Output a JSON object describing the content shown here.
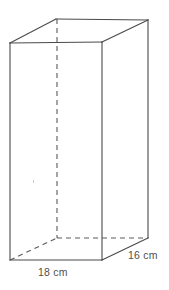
{
  "figure": {
    "kind": "rectangular-prism-diagram",
    "background_color": "#ffffff",
    "line_color": "#4a4a4a",
    "hidden_line_color": "#5a5a5a",
    "label_color": "#4f4f4f",
    "stroke_width": 1.1,
    "hidden_dash_pattern": "5,4",
    "labels": {
      "width": "18 cm",
      "depth": "16 cm"
    },
    "measurements": [
      {
        "name": "width",
        "value": 18,
        "unit": "cm",
        "edge": "front-bottom"
      },
      {
        "name": "depth",
        "value": 16,
        "unit": "cm",
        "edge": "right-bottom"
      }
    ],
    "vertices": {
      "front_top_left": [
        10,
        43
      ],
      "front_top_right": [
        102,
        42
      ],
      "front_bottom_right": [
        102,
        260
      ],
      "front_bottom_left": [
        10,
        260
      ],
      "back_top_left": [
        56,
        19
      ],
      "back_top_right": [
        148,
        20
      ],
      "back_bottom_right": [
        148,
        238
      ],
      "back_bottom_left": [
        57,
        238
      ]
    },
    "visible_edges": [
      "front-top",
      "front-right",
      "front-bottom",
      "front-left",
      "top-left-diagonal",
      "top-right-diagonal",
      "top-back",
      "back-right-vertical",
      "bottom-right-diagonal"
    ],
    "hidden_edges": [
      "back-left-vertical",
      "bottom-back",
      "bottom-left-diagonal"
    ]
  }
}
